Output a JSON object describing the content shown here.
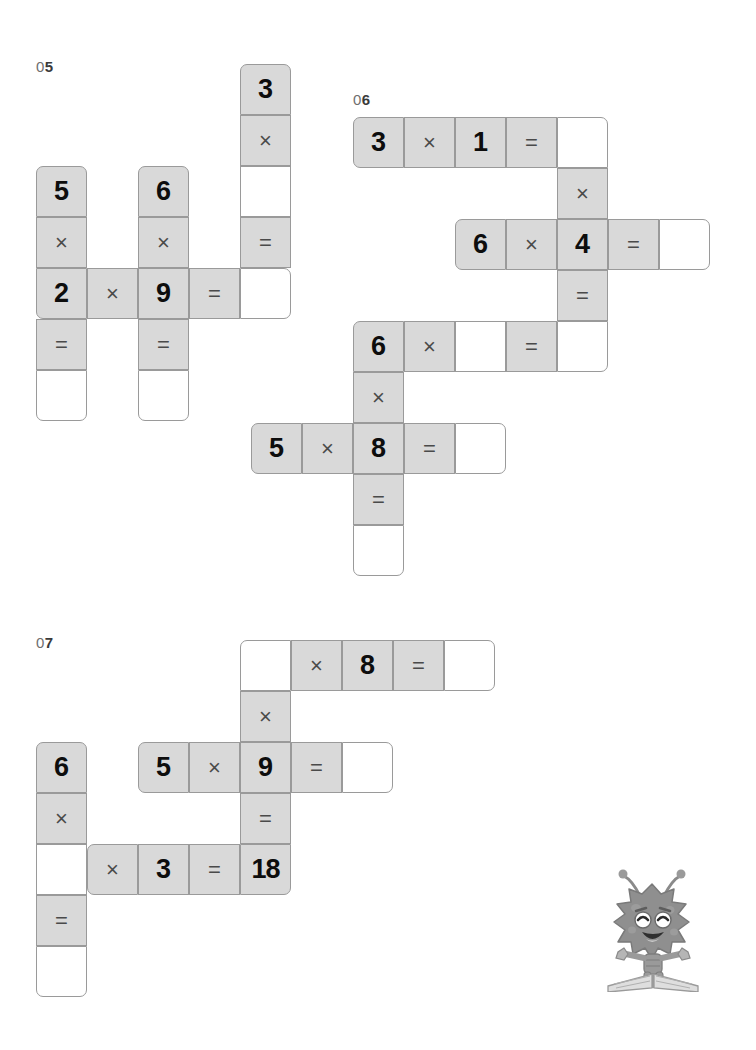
{
  "page": {
    "background_color": "#ffffff",
    "cell_fill_color": "#d9d9d9",
    "cell_blank_color": "#ffffff",
    "cell_border_color": "#9a9a9a",
    "text_color": "#111111",
    "label_color": "#3a3a3a"
  },
  "puzzles": [
    {
      "id": "puzzle-05",
      "label_zero": "0",
      "label_number": "5",
      "label_full": "05",
      "cell_size": 51,
      "origin": {
        "x": 36,
        "y": 64
      },
      "cells": [
        {
          "col": 4,
          "row": 0,
          "text": "3",
          "kind": "num",
          "filled": true,
          "corners": "tl tr"
        },
        {
          "col": 4,
          "row": 1,
          "text": "×",
          "kind": "op",
          "filled": true,
          "corners": ""
        },
        {
          "col": 4,
          "row": 2,
          "text": "",
          "kind": "blank",
          "filled": false,
          "corners": ""
        },
        {
          "col": 4,
          "row": 3,
          "text": "=",
          "kind": "op",
          "filled": true,
          "corners": ""
        },
        {
          "col": 4,
          "row": 4,
          "text": "",
          "kind": "blank",
          "filled": false,
          "corners": "tr br"
        },
        {
          "col": 0,
          "row": 2,
          "text": "5",
          "kind": "num",
          "filled": true,
          "corners": "tl tr"
        },
        {
          "col": 0,
          "row": 3,
          "text": "×",
          "kind": "op",
          "filled": true,
          "corners": ""
        },
        {
          "col": 0,
          "row": 4,
          "text": "2",
          "kind": "num",
          "filled": true,
          "corners": "bl"
        },
        {
          "col": 0,
          "row": 5,
          "text": "=",
          "kind": "op",
          "filled": true,
          "corners": ""
        },
        {
          "col": 0,
          "row": 6,
          "text": "",
          "kind": "blank",
          "filled": false,
          "corners": "bl br"
        },
        {
          "col": 1,
          "row": 4,
          "text": "×",
          "kind": "op",
          "filled": true,
          "corners": ""
        },
        {
          "col": 2,
          "row": 2,
          "text": "6",
          "kind": "num",
          "filled": true,
          "corners": "tl tr"
        },
        {
          "col": 2,
          "row": 3,
          "text": "×",
          "kind": "op",
          "filled": true,
          "corners": ""
        },
        {
          "col": 2,
          "row": 4,
          "text": "9",
          "kind": "num",
          "filled": true,
          "corners": ""
        },
        {
          "col": 2,
          "row": 5,
          "text": "=",
          "kind": "op",
          "filled": true,
          "corners": ""
        },
        {
          "col": 2,
          "row": 6,
          "text": "",
          "kind": "blank",
          "filled": false,
          "corners": "bl br"
        },
        {
          "col": 3,
          "row": 4,
          "text": "=",
          "kind": "op",
          "filled": true,
          "corners": ""
        }
      ],
      "equations": [
        {
          "direction": "horizontal",
          "expression": "2 × 9 = ?"
        },
        {
          "direction": "vertical",
          "expression": "5 × 2 = ?"
        },
        {
          "direction": "vertical",
          "expression": "6 × 9 = ?"
        },
        {
          "direction": "vertical",
          "expression": "3 × ? = ?"
        }
      ]
    },
    {
      "id": "puzzle-06",
      "label_zero": "0",
      "label_number": "6",
      "label_full": "06",
      "cell_size": 51,
      "origin": {
        "x": 353,
        "y": 117
      },
      "cells": [
        {
          "col": 0,
          "row": 0,
          "text": "3",
          "kind": "num",
          "filled": true,
          "corners": "tl bl"
        },
        {
          "col": 1,
          "row": 0,
          "text": "×",
          "kind": "op",
          "filled": true,
          "corners": ""
        },
        {
          "col": 2,
          "row": 0,
          "text": "1",
          "kind": "num",
          "filled": true,
          "corners": ""
        },
        {
          "col": 3,
          "row": 0,
          "text": "=",
          "kind": "op",
          "filled": true,
          "corners": ""
        },
        {
          "col": 4,
          "row": 0,
          "text": "",
          "kind": "blank",
          "filled": false,
          "corners": "tr"
        },
        {
          "col": 4,
          "row": 1,
          "text": "×",
          "kind": "op",
          "filled": true,
          "corners": ""
        },
        {
          "col": 2,
          "row": 2,
          "text": "6",
          "kind": "num",
          "filled": true,
          "corners": "tl bl"
        },
        {
          "col": 3,
          "row": 2,
          "text": "×",
          "kind": "op",
          "filled": true,
          "corners": ""
        },
        {
          "col": 4,
          "row": 2,
          "text": "4",
          "kind": "num",
          "filled": true,
          "corners": ""
        },
        {
          "col": 5,
          "row": 2,
          "text": "=",
          "kind": "op",
          "filled": true,
          "corners": ""
        },
        {
          "col": 6,
          "row": 2,
          "text": "",
          "kind": "blank",
          "filled": false,
          "corners": "tr br"
        },
        {
          "col": 4,
          "row": 3,
          "text": "=",
          "kind": "op",
          "filled": true,
          "corners": ""
        },
        {
          "col": 0,
          "row": 4,
          "text": "6",
          "kind": "num",
          "filled": true,
          "corners": "tl"
        },
        {
          "col": 1,
          "row": 4,
          "text": "×",
          "kind": "op",
          "filled": true,
          "corners": ""
        },
        {
          "col": 2,
          "row": 4,
          "text": "",
          "kind": "blank",
          "filled": false,
          "corners": ""
        },
        {
          "col": 3,
          "row": 4,
          "text": "=",
          "kind": "op",
          "filled": true,
          "corners": ""
        },
        {
          "col": 4,
          "row": 4,
          "text": "",
          "kind": "blank",
          "filled": false,
          "corners": "br"
        },
        {
          "col": 0,
          "row": 5,
          "text": "×",
          "kind": "op",
          "filled": true,
          "corners": ""
        },
        {
          "col": -2,
          "row": 6,
          "text": "5",
          "kind": "num",
          "filled": true,
          "corners": "tl bl"
        },
        {
          "col": -1,
          "row": 6,
          "text": "×",
          "kind": "op",
          "filled": true,
          "corners": ""
        },
        {
          "col": 0,
          "row": 6,
          "text": "8",
          "kind": "num",
          "filled": true,
          "corners": ""
        },
        {
          "col": 1,
          "row": 6,
          "text": "=",
          "kind": "op",
          "filled": true,
          "corners": ""
        },
        {
          "col": 2,
          "row": 6,
          "text": "",
          "kind": "blank",
          "filled": false,
          "corners": "tr br"
        },
        {
          "col": 0,
          "row": 7,
          "text": "=",
          "kind": "op",
          "filled": true,
          "corners": ""
        },
        {
          "col": 0,
          "row": 8,
          "text": "",
          "kind": "blank",
          "filled": false,
          "corners": "bl br"
        }
      ],
      "equations": [
        {
          "direction": "horizontal",
          "expression": "3 × 1 = ?"
        },
        {
          "direction": "horizontal",
          "expression": "6 × 4 = ?"
        },
        {
          "direction": "horizontal",
          "expression": "6 × ? = ?"
        },
        {
          "direction": "horizontal",
          "expression": "5 × 8 = ?"
        },
        {
          "direction": "vertical",
          "expression": "? × 4 = ?"
        },
        {
          "direction": "vertical",
          "expression": "6 × 8 = ?"
        }
      ]
    },
    {
      "id": "puzzle-07",
      "label_zero": "0",
      "label_number": "7",
      "label_full": "07",
      "cell_size": 51,
      "origin": {
        "x": 36,
        "y": 640
      },
      "cells": [
        {
          "col": 4,
          "row": 0,
          "text": "",
          "kind": "blank",
          "filled": false,
          "corners": "tl"
        },
        {
          "col": 5,
          "row": 0,
          "text": "×",
          "kind": "op",
          "filled": true,
          "corners": ""
        },
        {
          "col": 6,
          "row": 0,
          "text": "8",
          "kind": "num",
          "filled": true,
          "corners": ""
        },
        {
          "col": 7,
          "row": 0,
          "text": "=",
          "kind": "op",
          "filled": true,
          "corners": ""
        },
        {
          "col": 8,
          "row": 0,
          "text": "",
          "kind": "blank",
          "filled": false,
          "corners": "tr br"
        },
        {
          "col": 4,
          "row": 1,
          "text": "×",
          "kind": "op",
          "filled": true,
          "corners": ""
        },
        {
          "col": 2,
          "row": 2,
          "text": "5",
          "kind": "num",
          "filled": true,
          "corners": "tl bl"
        },
        {
          "col": 3,
          "row": 2,
          "text": "×",
          "kind": "op",
          "filled": true,
          "corners": ""
        },
        {
          "col": 4,
          "row": 2,
          "text": "9",
          "kind": "num",
          "filled": true,
          "corners": ""
        },
        {
          "col": 5,
          "row": 2,
          "text": "=",
          "kind": "op",
          "filled": true,
          "corners": ""
        },
        {
          "col": 6,
          "row": 2,
          "text": "",
          "kind": "blank",
          "filled": false,
          "corners": "tr br"
        },
        {
          "col": 4,
          "row": 3,
          "text": "=",
          "kind": "op",
          "filled": true,
          "corners": ""
        },
        {
          "col": 0,
          "row": 2,
          "text": "6",
          "kind": "num",
          "filled": true,
          "corners": "tl tr"
        },
        {
          "col": 0,
          "row": 3,
          "text": "×",
          "kind": "op",
          "filled": true,
          "corners": ""
        },
        {
          "col": 0,
          "row": 4,
          "text": "",
          "kind": "blank",
          "filled": false,
          "corners": ""
        },
        {
          "col": 0,
          "row": 5,
          "text": "=",
          "kind": "op",
          "filled": true,
          "corners": ""
        },
        {
          "col": 0,
          "row": 6,
          "text": "",
          "kind": "blank",
          "filled": false,
          "corners": "bl br"
        },
        {
          "col": 1,
          "row": 4,
          "text": "×",
          "kind": "op",
          "filled": true,
          "corners": "tl bl"
        },
        {
          "col": 2,
          "row": 4,
          "text": "3",
          "kind": "num",
          "filled": true,
          "corners": ""
        },
        {
          "col": 3,
          "row": 4,
          "text": "=",
          "kind": "op",
          "filled": true,
          "corners": ""
        },
        {
          "col": 4,
          "row": 4,
          "text": "18",
          "kind": "num",
          "filled": true,
          "corners": "br"
        }
      ],
      "equations": [
        {
          "direction": "horizontal",
          "expression": "? × 8 = ?"
        },
        {
          "direction": "horizontal",
          "expression": "5 × 9 = ?"
        },
        {
          "direction": "horizontal",
          "expression": "? × 3 = 18"
        },
        {
          "direction": "vertical",
          "expression": "? × 9 = 18"
        },
        {
          "direction": "vertical",
          "expression": "6 × ? = ?"
        }
      ]
    }
  ],
  "mascot": {
    "name": "monster-on-book-mascot",
    "description": "cartoon spiky monster standing on an open book",
    "position": {
      "x": 594,
      "y": 862
    },
    "body_color": "#8c8c8c",
    "book_color": "#cfcfcf"
  }
}
